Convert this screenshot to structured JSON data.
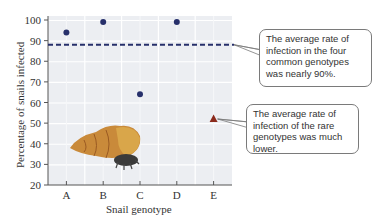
{
  "chart_data": {
    "type": "scatter",
    "title": "",
    "xlabel": "Snail genotype",
    "ylabel": "Percentage of snails infected",
    "categories": [
      "A",
      "B",
      "C",
      "D",
      "E"
    ],
    "series": [
      {
        "name": "Common genotypes",
        "marker": "circle",
        "color": "#27306b",
        "x": [
          "A",
          "B",
          "C",
          "D"
        ],
        "values": [
          94,
          99,
          64,
          99
        ]
      },
      {
        "name": "Rare genotypes",
        "marker": "triangle",
        "color": "#8b2a1c",
        "x": [
          "E"
        ],
        "values": [
          52
        ]
      }
    ],
    "reference_line": {
      "y": 88,
      "style": "dashed",
      "color": "#27306b",
      "label": "Average of common genotypes"
    },
    "ylim": [
      20,
      100
    ],
    "yticks": [
      20,
      30,
      40,
      50,
      60,
      70,
      80,
      90,
      100
    ],
    "grid": true,
    "annotations": [
      "The average rate of infection in the four common genotypes was nearly 90%.",
      "The average rate of infection of the rare genotypes was much lower."
    ]
  },
  "labels": {
    "xlabel": "Snail genotype",
    "ylabel": "Percentage of snails infected"
  },
  "callouts": {
    "common": "The average rate of infection in the four common genotypes was nearly 90%.",
    "rare": "The average rate of infection of the rare genotypes was much lower."
  },
  "illustration": "snail-image"
}
